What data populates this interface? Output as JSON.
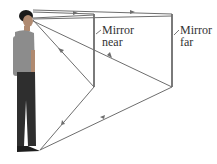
{
  "figure": {
    "labels": {
      "mirror_near": [
        "Mirror",
        "near"
      ],
      "mirror_far": [
        "Mirror",
        "far"
      ]
    },
    "colors": {
      "ray": "#6e6e6e",
      "mirror": "#7a7a7a",
      "person_skin": "#b08a70",
      "person_shirt": "#8c8c8c",
      "person_pants": "#2e2e2e",
      "person_hair": "#1a1a1a"
    }
  }
}
